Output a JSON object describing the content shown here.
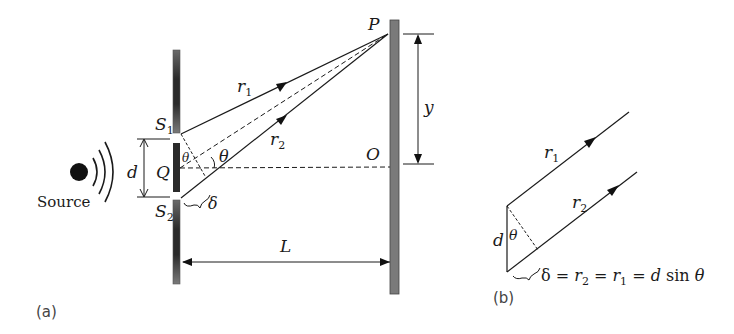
{
  "figure": {
    "panel_a": {
      "caption": "(a)",
      "source_label": "Source",
      "slit1": {
        "name": "S",
        "sub": "1"
      },
      "slit2": {
        "name": "S",
        "sub": "2"
      },
      "midpoint": "Q",
      "separation": "d",
      "ray1": {
        "name": "r",
        "sub": "1"
      },
      "ray2": {
        "name": "r",
        "sub": "2"
      },
      "angle": "θ",
      "angle_small": "θ",
      "path_difference": "δ",
      "point_p": "P",
      "point_o": "O",
      "screen_distance": "L",
      "height": "y"
    },
    "panel_b": {
      "caption": "(b)",
      "ray1": {
        "name": "r",
        "sub": "1"
      },
      "ray2": {
        "name": "r",
        "sub": "2"
      },
      "separation": "d",
      "angle": "θ",
      "equation": {
        "delta": "δ",
        "eq1": " = ",
        "r2": "r",
        "r2sub": "2",
        "eq2": " = ",
        "r1": "r",
        "r1sub": "1",
        "eq3": " = ",
        "d": "d",
        "sin": " sin ",
        "theta": "θ"
      }
    }
  },
  "colors": {
    "barrier": "#3a3a3a",
    "screen": "#7a7a7a",
    "line": "#1a1a1a"
  }
}
